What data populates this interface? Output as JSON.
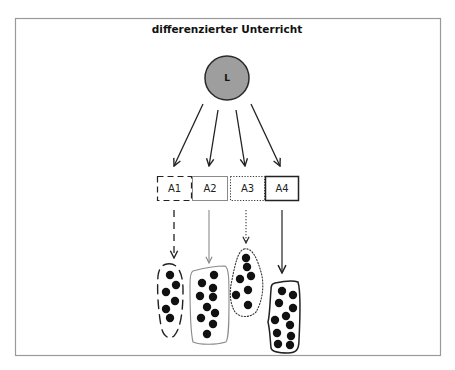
{
  "title": "differenzierter Unterricht",
  "teacher": {
    "label": "L",
    "fill": "#9e9e9e",
    "stroke": "#2a2a2a",
    "cx": 227,
    "cy": 78,
    "r": 22
  },
  "frame": {
    "x": 15.5,
    "y": 18.5,
    "width": 425,
    "height": 337,
    "stroke": "#9a9a9a"
  },
  "tasks": [
    {
      "id": "A1",
      "label": "A1",
      "style": "dashed",
      "x": 157,
      "y": 176,
      "w": 34,
      "h": 24,
      "stroke": "#222222",
      "dash": "6,4",
      "stroke_width": 1.2
    },
    {
      "id": "A2",
      "label": "A2",
      "style": "thin-gray",
      "x": 192,
      "y": 176,
      "w": 35,
      "h": 24,
      "stroke": "#8a8a8a",
      "dash": "",
      "stroke_width": 1
    },
    {
      "id": "A3",
      "label": "A3",
      "style": "dotted",
      "x": 230,
      "y": 176,
      "w": 34,
      "h": 24,
      "stroke": "#333333",
      "dash": "1.2,1.6",
      "stroke_width": 1
    },
    {
      "id": "A4",
      "label": "A4",
      "style": "solid-dark",
      "x": 265,
      "y": 176,
      "w": 33,
      "h": 24,
      "stroke": "#222222",
      "dash": "",
      "stroke_width": 1.5
    }
  ],
  "teacher_arrows": [
    {
      "x1": 203,
      "y1": 104,
      "x2": 174,
      "y2": 166
    },
    {
      "x1": 218,
      "y1": 110,
      "x2": 209,
      "y2": 166
    },
    {
      "x1": 236,
      "y1": 110,
      "x2": 245,
      "y2": 166
    },
    {
      "x1": 251,
      "y1": 104,
      "x2": 280,
      "y2": 166
    }
  ],
  "group_arrows": [
    {
      "task": "A1",
      "x": 174,
      "y1": 210,
      "y2": 258,
      "stroke": "#222222",
      "dash": "7,5",
      "width": 1.3
    },
    {
      "task": "A2",
      "x": 209,
      "y1": 210,
      "y2": 263,
      "stroke": "#8a8a8a",
      "dash": "",
      "width": 1.1
    },
    {
      "task": "A3",
      "x": 246,
      "y1": 210,
      "y2": 243,
      "stroke": "#333333",
      "dash": "1.2,1.8",
      "width": 1.1
    },
    {
      "task": "A4",
      "x": 282,
      "y1": 210,
      "y2": 273,
      "stroke": "#444444",
      "dash": "",
      "width": 1.4
    }
  ],
  "groups": [
    {
      "task": "A1",
      "outline": "M167,264 C177,262 183,272 183,290 C183,310 181,328 174,336 C168,340 163,336 161,326 C158,308 157,290 158,276 C159,268 162,265 167,264 Z",
      "stroke": "#222222",
      "dash": "9,6",
      "stroke_width": 1.4,
      "dots": [
        [
          170,
          275
        ],
        [
          176,
          285
        ],
        [
          166,
          292
        ],
        [
          175,
          301
        ],
        [
          166,
          309
        ],
        [
          170,
          318
        ]
      ]
    },
    {
      "task": "A2",
      "outline": "M193,271 C204,268 217,266 225,266 C229,268 229,280 229,300 C229,320 229,338 226,342 C216,345 200,345 193,342 C190,330 190,300 190,285 C190,276 191,272 193,271 Z",
      "stroke": "#8a8a8a",
      "dash": "",
      "stroke_width": 1.1,
      "dots": [
        [
          214,
          275
        ],
        [
          202,
          283
        ],
        [
          213,
          288
        ],
        [
          200,
          296
        ],
        [
          213,
          297
        ],
        [
          207,
          307
        ],
        [
          215,
          313
        ],
        [
          201,
          318
        ],
        [
          213,
          324
        ],
        [
          207,
          334
        ]
      ]
    },
    {
      "task": "A3",
      "outline": "M244,249 C252,247 257,258 261,272 C265,286 262,302 256,312 C250,318 240,318 235,312 C230,304 229,292 232,280 C235,264 238,251 244,249 Z",
      "stroke": "#333333",
      "dash": "1.2,1.8",
      "stroke_width": 1.1,
      "dots": [
        [
          246,
          258
        ],
        [
          247,
          267
        ],
        [
          240,
          279
        ],
        [
          251,
          276
        ],
        [
          248,
          290
        ],
        [
          236,
          295
        ],
        [
          248,
          305
        ]
      ]
    },
    {
      "task": "A4",
      "outline": "M275,283 C284,281 293,280 298,282 C301,292 300,320 299,340 C299,350 296,353 288,353 C280,353 272,352 271,348 C270,338 270,330 268,322 C270,314 270,300 271,290 C271,285 272,284 275,283 Z",
      "stroke": "#222222",
      "dash": "",
      "stroke_width": 1.5,
      "dots": [
        [
          282,
          291
        ],
        [
          293,
          295
        ],
        [
          279,
          303
        ],
        [
          293,
          308
        ],
        [
          286,
          316
        ],
        [
          275,
          320
        ],
        [
          290,
          325
        ],
        [
          277,
          333
        ],
        [
          291,
          336
        ],
        [
          278,
          344
        ],
        [
          290,
          345
        ]
      ]
    }
  ],
  "dot_radius": 4.2,
  "dot_color": "#111111",
  "arrow_color": "#222222"
}
